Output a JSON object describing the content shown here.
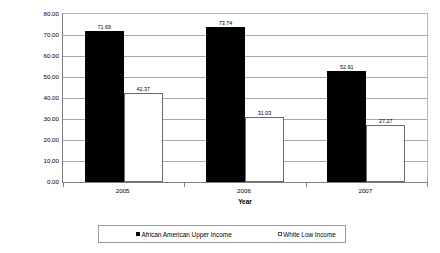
{
  "chart_data": {
    "type": "bar",
    "title": "",
    "xlabel": "Year",
    "ylabel": "Percent High-Cost",
    "categories": [
      "2005",
      "2006",
      "2007"
    ],
    "series": [
      {
        "name": "African American Upper Income",
        "color": "#000000",
        "values": [
          71.69,
          73.74,
          52.91
        ],
        "value_labels": [
          "71.69",
          "73.74",
          "52.91"
        ]
      },
      {
        "name": "White Low Income",
        "color": "#FFFFFF",
        "values": [
          42.37,
          31.03,
          27.27
        ],
        "value_labels": [
          "42.37",
          "31.03",
          "27.27"
        ]
      }
    ],
    "ylim": [
      0,
      80
    ],
    "ytick_step": 10,
    "ytick_labels": [
      "80.00",
      "70.00",
      "60.00",
      "50.00",
      "40.00",
      "30.00",
      "20.00",
      "10.00",
      "0.00"
    ],
    "ytick_values": [
      80,
      70,
      60,
      50,
      40,
      30,
      20,
      10,
      0
    ],
    "grid": true,
    "legend_position": "bottom"
  }
}
